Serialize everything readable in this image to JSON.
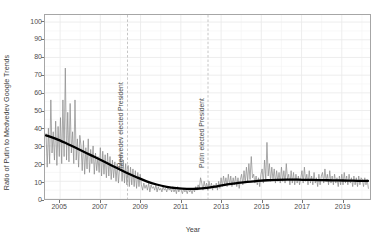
{
  "chart_data": {
    "type": "line",
    "title": "",
    "xlabel": "Year",
    "ylabel": "Ratio of Putin to Medvedev Google Trends",
    "xlim": [
      2004.25,
      2020.4
    ],
    "ylim": [
      0,
      104
    ],
    "xticks": [
      2005,
      2007,
      2009,
      2011,
      2013,
      2015,
      2017,
      2019
    ],
    "xticklabels": [
      "2005",
      "2007",
      "2009",
      "2011",
      "2013",
      "2015",
      "2017",
      "2019"
    ],
    "yticks": [
      0,
      10,
      20,
      30,
      40,
      50,
      60,
      70,
      80,
      90,
      100
    ],
    "yticklabels": [
      "0",
      "10",
      "20",
      "30",
      "40",
      "50",
      "60",
      "70",
      "80",
      "90",
      "100"
    ],
    "grid": true,
    "grid_minor": true,
    "legend": "none",
    "series": [
      {
        "name": "Ratio of Putin to Medvedev Google Trends",
        "style": "raw-weekly",
        "color": "#8c8c8c",
        "x": [
          2004.3,
          2004.36,
          2004.42,
          2004.48,
          2004.54,
          2004.6,
          2004.66,
          2004.72,
          2004.78,
          2004.84,
          2004.9,
          2004.96,
          2005.02,
          2005.08,
          2005.14,
          2005.2,
          2005.26,
          2005.32,
          2005.38,
          2005.44,
          2005.5,
          2005.56,
          2005.62,
          2005.68,
          2005.74,
          2005.8,
          2005.86,
          2005.92,
          2005.98,
          2006.04,
          2006.1,
          2006.16,
          2006.22,
          2006.28,
          2006.34,
          2006.4,
          2006.46,
          2006.52,
          2006.58,
          2006.64,
          2006.7,
          2006.76,
          2006.82,
          2006.88,
          2006.94,
          2007.0,
          2007.06,
          2007.12,
          2007.18,
          2007.24,
          2007.3,
          2007.36,
          2007.42,
          2007.48,
          2007.54,
          2007.6,
          2007.66,
          2007.72,
          2007.78,
          2007.84,
          2007.9,
          2007.96,
          2008.02,
          2008.08,
          2008.14,
          2008.2,
          2008.26,
          2008.32,
          2008.38,
          2008.44,
          2008.5,
          2008.56,
          2008.62,
          2008.68,
          2008.74,
          2008.8,
          2008.86,
          2008.92,
          2008.98,
          2009.04,
          2009.1,
          2009.16,
          2009.22,
          2009.28,
          2009.34,
          2009.4,
          2009.46,
          2009.52,
          2009.58,
          2009.64,
          2009.7,
          2009.76,
          2009.82,
          2009.88,
          2009.94,
          2010.0,
          2010.06,
          2010.12,
          2010.18,
          2010.24,
          2010.3,
          2010.36,
          2010.42,
          2010.48,
          2010.54,
          2010.6,
          2010.66,
          2010.72,
          2010.78,
          2010.84,
          2010.9,
          2010.96,
          2011.02,
          2011.08,
          2011.14,
          2011.2,
          2011.26,
          2011.32,
          2011.38,
          2011.44,
          2011.5,
          2011.56,
          2011.62,
          2011.68,
          2011.74,
          2011.8,
          2011.86,
          2011.92,
          2011.98,
          2012.04,
          2012.1,
          2012.16,
          2012.22,
          2012.28,
          2012.34,
          2012.4,
          2012.46,
          2012.52,
          2012.58,
          2012.64,
          2012.7,
          2012.76,
          2012.82,
          2012.88,
          2012.94,
          2013.0,
          2013.06,
          2013.12,
          2013.18,
          2013.24,
          2013.3,
          2013.36,
          2013.42,
          2013.48,
          2013.54,
          2013.6,
          2013.66,
          2013.72,
          2013.78,
          2013.84,
          2013.9,
          2013.96,
          2014.02,
          2014.08,
          2014.14,
          2014.2,
          2014.26,
          2014.32,
          2014.38,
          2014.44,
          2014.5,
          2014.56,
          2014.62,
          2014.68,
          2014.74,
          2014.8,
          2014.86,
          2014.92,
          2014.98,
          2015.04,
          2015.1,
          2015.16,
          2015.22,
          2015.28,
          2015.34,
          2015.4,
          2015.46,
          2015.52,
          2015.58,
          2015.64,
          2015.7,
          2015.76,
          2015.82,
          2015.88,
          2015.94,
          2016.0,
          2016.06,
          2016.12,
          2016.18,
          2016.24,
          2016.3,
          2016.36,
          2016.42,
          2016.48,
          2016.54,
          2016.6,
          2016.66,
          2016.72,
          2016.78,
          2016.84,
          2016.9,
          2016.96,
          2017.02,
          2017.08,
          2017.14,
          2017.2,
          2017.26,
          2017.32,
          2017.38,
          2017.44,
          2017.5,
          2017.56,
          2017.62,
          2017.68,
          2017.74,
          2017.8,
          2017.86,
          2017.92,
          2017.98,
          2018.04,
          2018.1,
          2018.16,
          2018.22,
          2018.28,
          2018.34,
          2018.4,
          2018.46,
          2018.52,
          2018.58,
          2018.64,
          2018.7,
          2018.76,
          2018.82,
          2018.88,
          2018.94,
          2019.0,
          2019.06,
          2019.12,
          2019.18,
          2019.24,
          2019.3,
          2019.36,
          2019.42,
          2019.48,
          2019.54,
          2019.6,
          2019.66,
          2019.72,
          2019.78,
          2019.84,
          2019.9,
          2019.96,
          2020.02,
          2020.08,
          2020.14,
          2020.2,
          2020.26,
          2020.32
        ],
        "y": [
          37,
          18,
          40,
          20,
          56,
          26,
          38,
          22,
          44,
          19,
          41,
          24,
          46,
          20,
          56,
          24,
          74,
          22,
          49,
          21,
          54,
          26,
          38,
          20,
          56,
          22,
          34,
          18,
          36,
          30,
          16,
          33,
          14,
          29,
          17,
          34,
          15,
          28,
          20,
          30,
          14,
          26,
          16,
          24,
          15,
          29,
          13,
          27,
          14,
          25,
          12,
          26,
          13,
          24,
          11,
          22,
          12,
          21,
          10,
          20,
          9,
          18,
          25,
          10,
          22,
          9,
          20,
          8,
          19,
          7,
          18,
          8,
          17,
          7,
          16,
          6,
          15,
          7,
          14,
          8,
          5,
          9,
          6,
          8,
          5,
          9,
          4,
          8,
          6,
          7,
          5,
          8,
          4,
          7,
          5,
          6,
          4,
          7,
          5,
          6,
          4,
          7,
          5,
          6,
          4,
          7,
          4,
          6,
          3,
          7,
          4,
          6,
          5,
          3,
          6,
          4,
          5,
          3,
          6,
          4,
          5,
          3,
          6,
          4,
          7,
          5,
          8,
          6,
          12,
          9,
          5,
          10,
          6,
          9,
          5,
          10,
          6,
          9,
          5,
          8,
          6,
          9,
          5,
          10,
          6,
          12,
          7,
          13,
          8,
          12,
          7,
          14,
          8,
          13,
          7,
          12,
          8,
          13,
          7,
          12,
          6,
          11,
          14,
          8,
          16,
          9,
          18,
          10,
          20,
          11,
          24,
          12,
          14,
          9,
          13,
          8,
          12,
          7,
          14,
          17,
          9,
          22,
          11,
          32,
          13,
          20,
          10,
          18,
          11,
          17,
          9,
          16,
          10,
          15,
          9,
          18,
          10,
          16,
          9,
          20,
          11,
          14,
          8,
          16,
          9,
          15,
          8,
          14,
          9,
          13,
          8,
          12,
          16,
          9,
          18,
          10,
          14,
          8,
          16,
          9,
          13,
          8,
          15,
          9,
          12,
          7,
          14,
          8,
          13,
          15,
          9,
          17,
          10,
          14,
          8,
          16,
          9,
          13,
          8,
          14,
          9,
          12,
          7,
          13,
          8,
          14,
          8,
          15,
          9,
          13,
          8,
          14,
          9,
          12,
          7,
          13,
          8,
          12,
          7,
          13,
          8,
          12,
          11,
          7,
          12,
          8,
          11,
          6
        ]
      },
      {
        "name": "Smoothed trend (LOESS)",
        "style": "trend",
        "color": "#000000",
        "x": [
          2004.3,
          2004.8,
          2005.3,
          2005.8,
          2006.3,
          2006.8,
          2007.3,
          2007.8,
          2008.3,
          2008.8,
          2009.3,
          2009.8,
          2010.3,
          2010.8,
          2011.3,
          2011.8,
          2012.3,
          2012.8,
          2013.3,
          2013.8,
          2014.3,
          2014.8,
          2015.3,
          2015.8,
          2016.3,
          2016.8,
          2017.3,
          2017.8,
          2018.3,
          2018.8,
          2019.3,
          2019.8,
          2020.3
        ],
        "y": [
          36.0,
          34.0,
          31.5,
          28.8,
          26.0,
          23.3,
          20.5,
          17.6,
          14.8,
          12.3,
          10.0,
          8.2,
          6.9,
          6.1,
          5.7,
          5.8,
          6.3,
          7.2,
          8.2,
          9.0,
          9.7,
          10.2,
          10.6,
          10.8,
          10.9,
          10.9,
          10.8,
          10.7,
          10.6,
          10.5,
          10.4,
          10.3,
          10.2
        ]
      }
    ],
    "annotations": [
      {
        "id": "medvedev",
        "label": "Medvedev elected President",
        "x": 2008.35,
        "orientation": "vertical",
        "line": "dashed"
      },
      {
        "id": "putin",
        "label": "Putin elected President",
        "x": 2012.35,
        "orientation": "vertical",
        "line": "dashed"
      }
    ]
  },
  "colors": {
    "series": "#8c8c8c",
    "trend": "#000000",
    "grid_major": "#ebebeb",
    "grid_minor": "#f5f5f5",
    "panel_border": "#a6a6a6",
    "text": "#4d4d4d",
    "background": "#ffffff"
  }
}
